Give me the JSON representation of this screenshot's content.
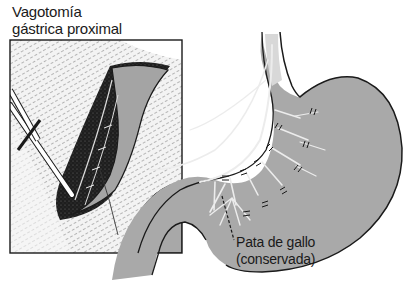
{
  "figure": {
    "title_line1": "Vagotomía",
    "title_line2": "gástrica proximal",
    "callout_line1": "Pata de gallo",
    "callout_line2": "(conservada)"
  },
  "colors": {
    "stomach_fill": "#a9a9a9",
    "outline": "#1f1f1f",
    "nerve": "#e6e6e6",
    "hatch_bg": "#f2f2f2",
    "cavity": "#2a2a2a"
  },
  "icons": {
    "inset": "surgical-field-inset",
    "organ": "stomach-illustration",
    "ligature": "double-tick-ligature"
  }
}
